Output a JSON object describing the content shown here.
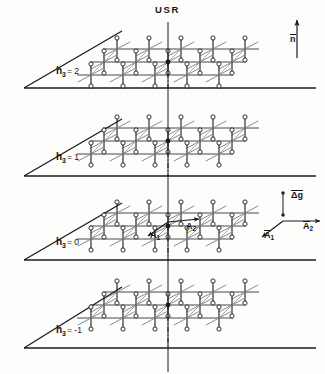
{
  "figure": {
    "title": "USR",
    "background": "#fdfdfc",
    "ink": "#1a1a1a",
    "lattice_ink": "#8a8a8a"
  },
  "planes": [
    {
      "id": "h3-2",
      "label_var": "h",
      "label_sub": "3",
      "label_eq": "= 2",
      "value": 2,
      "baseline_y": 88,
      "lattice_cy": 62,
      "vertex_x": 24,
      "right_x": 316,
      "apex_x": 122,
      "apex_y": 31
    },
    {
      "id": "h3-1",
      "label_var": "h",
      "label_sub": "3",
      "label_eq": "= 1",
      "value": 1,
      "baseline_y": 176,
      "lattice_cy": 141,
      "vertex_x": 24,
      "right_x": 316,
      "apex_x": 122,
      "apex_y": 119
    },
    {
      "id": "h3-0",
      "label_var": "h",
      "label_sub": "3",
      "label_eq": "= 0",
      "value": 0,
      "baseline_y": 260,
      "lattice_cy": 226,
      "vertex_x": 24,
      "right_x": 316,
      "apex_x": 122,
      "apex_y": 203
    },
    {
      "id": "h3-m1",
      "label_var": "h",
      "label_sub": "3",
      "label_eq": "= -1",
      "value": -1,
      "baseline_y": 348,
      "lattice_cy": 305,
      "vertex_x": 24,
      "right_x": 316,
      "apex_x": 122,
      "apex_y": 287
    }
  ],
  "axis": {
    "name": "vertical-axis",
    "x": 168,
    "top_y": 22,
    "bottom_y": 372
  },
  "lattice": {
    "rows": 3,
    "cols": 5,
    "spacing_x": 32,
    "row_offset_x": -13,
    "row_offset_y": 13,
    "origin_col": 2,
    "origin_row": 1,
    "motif": "dumbbell",
    "motif_half_height": 11,
    "node_radius": 2.1,
    "diagonal_len": 17
  },
  "vectors": {
    "n": {
      "label": "n",
      "overbar": true,
      "name": "normal-vector",
      "x": 297,
      "tip_y": 20,
      "tail_y": 58,
      "label_x": 290,
      "label_y": 40
    },
    "dg": {
      "label": "Δg",
      "overbar": true,
      "name": "delta-g-vector",
      "x": 283,
      "top_y": 193,
      "bottom_y": 215,
      "label_x": 291,
      "label_y": 196
    },
    "a1": {
      "label": "A",
      "sub": "1",
      "name": "a1-axis-vector",
      "x1": 283,
      "y1": 221,
      "x2": 262,
      "y2": 237,
      "label_x": 263,
      "label_y": 236
    },
    "a2": {
      "label": "A",
      "sub": "2",
      "name": "a2-axis-vector",
      "x1": 283,
      "y1": 221,
      "x2": 320,
      "y2": 221,
      "label_x": 304,
      "label_y": 222
    },
    "a1_inplane": {
      "label": "A",
      "sub": "1",
      "name": "a1-inplane-vector",
      "x1": 168,
      "y1": 222,
      "x2": 148,
      "y2": 236,
      "label_x": 150,
      "label_y": 236
    },
    "a2_inplane": {
      "label": "A",
      "sub": "2",
      "name": "a2-inplane-vector",
      "x1": 168,
      "y1": 222,
      "x2": 199,
      "y2": 219,
      "label_x": 185,
      "label_y": 228
    }
  }
}
